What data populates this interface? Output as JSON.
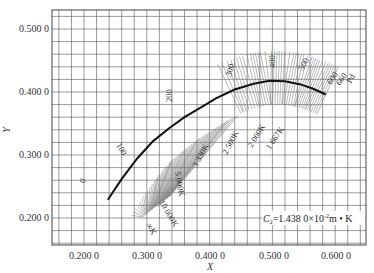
{
  "chart_data": {
    "type": "line",
    "title": "",
    "xlabel": "X",
    "ylabel": "Y",
    "xlim": [
      0.15,
      0.65
    ],
    "ylim": [
      0.15,
      0.52
    ],
    "grid": true,
    "x_ticks": [
      "0.200 0",
      "0.300 0",
      "0.400 0",
      "0.500 0",
      "0.600 0"
    ],
    "y_ticks": [
      "0.200 0",
      "0.300 0",
      "0.400 0",
      "0.500 0"
    ],
    "annotation": "C2=1.438 0×10⁻²m • K",
    "series": [
      {
        "name": "Planckian locus",
        "points": [
          [
            0.238,
            0.229
          ],
          [
            0.26,
            0.262
          ],
          [
            0.285,
            0.295
          ],
          [
            0.31,
            0.322
          ],
          [
            0.335,
            0.342
          ],
          [
            0.36,
            0.36
          ],
          [
            0.385,
            0.375
          ],
          [
            0.41,
            0.39
          ],
          [
            0.44,
            0.404
          ],
          [
            0.47,
            0.413
          ],
          [
            0.495,
            0.418
          ],
          [
            0.52,
            0.417
          ],
          [
            0.545,
            0.412
          ],
          [
            0.565,
            0.405
          ],
          [
            0.585,
            0.396
          ]
        ]
      }
    ],
    "temperature_labels": [
      "∞K",
      "10 000K",
      "5 000K",
      "3 330K",
      "2 500K",
      "2 000K",
      "1 667K"
    ],
    "isotemperature_index_labels": [
      "0",
      "100",
      "200",
      "300",
      "400",
      "500",
      "600",
      "660",
      "Pd"
    ]
  },
  "labels": {
    "x_axis": "X",
    "y_axis": "Y",
    "note_prefix": "C",
    "note_sub": "2",
    "note_main": "=1.438 0×10",
    "note_sup": "-2",
    "note_tail": "m • K",
    "x_tick_0": "0.200 0",
    "x_tick_1": "0.300 0",
    "x_tick_2": "0.400 0",
    "x_tick_3": "0.500 0",
    "x_tick_4": "0.600 0",
    "y_tick_0": "0.200 0",
    "y_tick_1": "0.300 0",
    "y_tick_2": "0.400 0",
    "y_tick_3": "0.500 0",
    "t_inf": "∞K",
    "t_10000": "10 000K",
    "t_5000": "5 000K",
    "t_3330": "3 330K",
    "t_2500": "2 500K",
    "t_2000": "2 000K",
    "t_1667": "1 667K",
    "i_0": "0",
    "i_100": "100",
    "i_200": "200",
    "i_300": "300",
    "i_400": "400",
    "i_500": "500",
    "i_600": "600",
    "i_660": "660",
    "i_pd": "Pd"
  },
  "colors": {
    "grid": "#555555",
    "hatch": "#777777",
    "locus": "#111111",
    "text": "#333333"
  }
}
